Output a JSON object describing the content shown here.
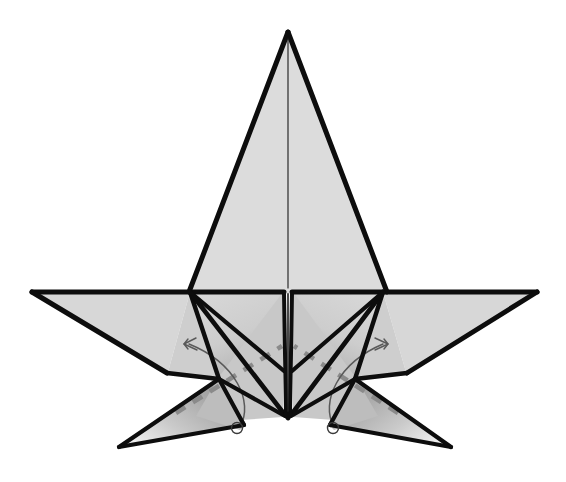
{
  "document": {
    "kind": "origami-folding-diagram",
    "title": "Origami star base — rotate lower flaps outward",
    "background_color": "#ffffff",
    "width": 566,
    "height": 482
  },
  "palette": {
    "paper_light": "#dcdcdc",
    "paper_mid": "#cfcfcf",
    "paper_shadow": "#9a9a9a",
    "paper_dark": "#6f6f6f",
    "paper_white": "#ffffff",
    "edge_stroke": "#0d0d0d",
    "crease_stroke": "#1a1a1a",
    "dashed_fold_stroke": "#8a8a8a",
    "arrow_stroke": "#595959",
    "pivot_stroke": "#3a3a3a"
  },
  "geometry": {
    "apex": {
      "x": 288,
      "y": 32
    },
    "left_wing_tip": {
      "x": 32,
      "y": 292
    },
    "right_wing_tip": {
      "x": 537,
      "y": 292
    },
    "left_shoulder": {
      "x": 190,
      "y": 292
    },
    "right_shoulder": {
      "x": 383,
      "y": 292
    },
    "center_horizon": {
      "x": 288,
      "y": 292
    },
    "bottom_point": {
      "x": 288,
      "y": 417
    },
    "left_leg_tip": {
      "x": 118,
      "y": 447
    },
    "right_leg_tip": {
      "x": 452,
      "y": 447
    },
    "left_knee": {
      "x": 218,
      "y": 378
    },
    "right_knee": {
      "x": 356,
      "y": 378
    },
    "left_pivot": {
      "x": 237,
      "y": 428
    },
    "right_pivot": {
      "x": 333,
      "y": 428
    },
    "left_arrow_tip": {
      "x": 184,
      "y": 343
    },
    "right_arrow_tip": {
      "x": 387,
      "y": 343
    },
    "spine_gap_half_width": 3.5
  },
  "shapes": {
    "main_cone": {
      "label": "central-cone-flap",
      "points": "288,32 190,292 386,292",
      "fill": "#dcdcdc"
    },
    "left_wing": {
      "label": "left-wing-flap",
      "points": "32,292 190,292 168,372",
      "fill": "#d6d6d6"
    },
    "right_wing": {
      "label": "right-wing-flap",
      "points": "537,292 383,292 406,372",
      "fill": "#d6d6d6"
    },
    "left_inner_panel": {
      "label": "left-inner-panel",
      "points": "190,292 283,292 283,368 218,378",
      "fill": "#d2d2d2"
    },
    "right_inner_panel": {
      "label": "right-inner-panel",
      "points": "383,292 293,292 293,368 356,378",
      "fill": "#d2d2d2"
    },
    "left_leg": {
      "label": "left-rotating-leg",
      "points": "118,447 218,378 245,424",
      "fill": "url(#legShadeLeft)"
    },
    "right_leg": {
      "label": "right-rotating-leg",
      "points": "452,447 356,378 329,424",
      "fill": "url(#legShadeRight)"
    }
  },
  "annotations": {
    "left_rotation_arrow": {
      "name": "rotate-left-flap-arrow",
      "direction": "counterclockwise-outward-left",
      "arc_path": "M 240,424 C 252,400 234,362 190,345"
    },
    "right_rotation_arrow": {
      "name": "rotate-right-flap-arrow",
      "direction": "clockwise-outward-right",
      "arc_path": "M 334,424 C 322,400 340,362 382,345"
    },
    "left_dashed_fold": {
      "name": "left-mountain-fold-line",
      "path": "M 175,414 L 283,345",
      "style": "dashed"
    },
    "right_dashed_fold": {
      "name": "right-mountain-fold-line",
      "path": "M 399,414 L 293,345",
      "style": "dashed"
    },
    "left_pivot_marker": {
      "name": "left-pivot-point",
      "r": 5.5
    },
    "right_pivot_marker": {
      "name": "right-pivot-point",
      "r": 5.5
    }
  },
  "strokes": {
    "outer_edge_width": 5.0,
    "inner_crease_width": 4.0,
    "leg_edge_width": 4.0,
    "spine_width": 4.0
  }
}
